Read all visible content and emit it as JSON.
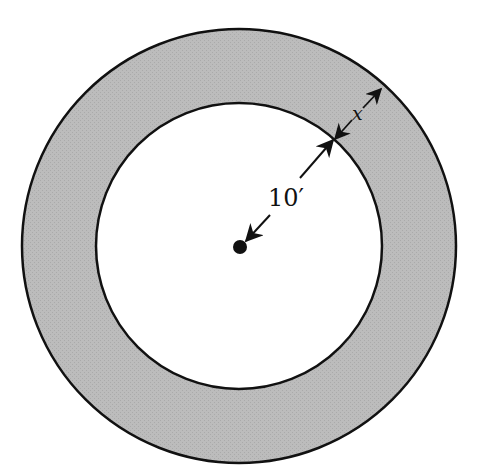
{
  "figure": {
    "type": "annulus-diagram",
    "colors": {
      "ring_fill": "#b9b9b9",
      "inner_fill": "#ffffff",
      "stroke": "#111111",
      "background": "#ffffff"
    },
    "outer_circle": {
      "cx": 239,
      "cy": 246,
      "r": 217
    },
    "inner_circle": {
      "cx": 239,
      "cy": 246,
      "r": 143
    },
    "center_dot": {
      "cx": 240,
      "cy": 247,
      "r": 7
    },
    "labels": {
      "radius": "10′",
      "width": "x"
    },
    "dimensions": [
      {
        "name": "inner-radius",
        "label": "10′",
        "from": "center",
        "to": "inner circle"
      },
      {
        "name": "ring-width",
        "label": "x",
        "from": "inner circle",
        "to": "outer circle"
      }
    ]
  }
}
